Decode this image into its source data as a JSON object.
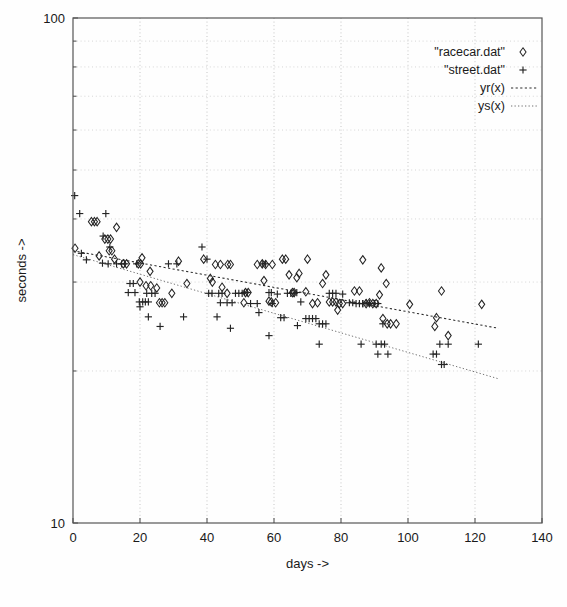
{
  "chart_data": {
    "type": "scatter",
    "title": "",
    "xlabel": "days ->",
    "ylabel": "seconds  ->",
    "xlim": [
      0,
      140
    ],
    "ylim": [
      10,
      100
    ],
    "yscale": "log",
    "xscale": "linear",
    "grid": true,
    "legend_position": "top-right",
    "xticks": [
      0,
      20,
      40,
      60,
      80,
      100,
      120,
      140
    ],
    "xtick_labels": [
      "0",
      "20",
      "40",
      "60",
      "80",
      "100",
      "120",
      "140"
    ],
    "yticks": [
      10,
      100
    ],
    "ytick_labels": [
      "10",
      "100"
    ],
    "y_minor_gridlines": [
      20,
      30,
      40,
      50,
      60,
      70,
      80,
      90
    ],
    "legend": [
      {
        "label": "\"racecar.dat\"",
        "marker": "diamond",
        "kind": "points"
      },
      {
        "label": "\"street.dat\"",
        "marker": "plus",
        "kind": "points"
      },
      {
        "label": "yr(x)",
        "marker": "dashed-line",
        "kind": "line"
      },
      {
        "label": "ys(x)",
        "marker": "dotted-line",
        "kind": "line"
      }
    ],
    "series": [
      {
        "name": "\"racecar.dat\"",
        "marker": "diamond",
        "points": [
          [
            0.6,
            35.0
          ],
          [
            5.5,
            39.5
          ],
          [
            6.4,
            39.5
          ],
          [
            7.2,
            39.5
          ],
          [
            9.5,
            36.5
          ],
          [
            10.4,
            36.5
          ],
          [
            11.2,
            36.5
          ],
          [
            13.0,
            38.5
          ],
          [
            7.8,
            33.8
          ],
          [
            10.8,
            34.6
          ],
          [
            11.6,
            34.6
          ],
          [
            12.4,
            33.3
          ],
          [
            15.0,
            32.6
          ],
          [
            16.0,
            32.6
          ],
          [
            19.5,
            32.6
          ],
          [
            20.2,
            32.6
          ],
          [
            20.6,
            33.5
          ],
          [
            23.0,
            31.5
          ],
          [
            20.0,
            30.0
          ],
          [
            21.8,
            29.5
          ],
          [
            23.2,
            29.5
          ],
          [
            25.0,
            29.2
          ],
          [
            25.8,
            27.3
          ],
          [
            26.6,
            27.3
          ],
          [
            27.4,
            27.3
          ],
          [
            29.5,
            28.5
          ],
          [
            31.5,
            33.0
          ],
          [
            34.0,
            29.8
          ],
          [
            39.0,
            33.3
          ],
          [
            41.0,
            30.5
          ],
          [
            41.6,
            30.0
          ],
          [
            42.5,
            32.5
          ],
          [
            44.0,
            32.5
          ],
          [
            44.5,
            29.3
          ],
          [
            46.2,
            32.5
          ],
          [
            47.0,
            32.5
          ],
          [
            46.0,
            28.5
          ],
          [
            51.5,
            28.6
          ],
          [
            52.3,
            28.6
          ],
          [
            51.0,
            27.3
          ],
          [
            55.0,
            32.5
          ],
          [
            56.5,
            32.6
          ],
          [
            57.5,
            32.5
          ],
          [
            57.0,
            30.2
          ],
          [
            59.5,
            32.5
          ],
          [
            58.5,
            27.5
          ],
          [
            59.2,
            27.4
          ],
          [
            60.5,
            27.3
          ],
          [
            62.5,
            33.3
          ],
          [
            63.5,
            33.3
          ],
          [
            64.5,
            31.0
          ],
          [
            65.5,
            28.6
          ],
          [
            66.0,
            28.6
          ],
          [
            66.8,
            30.6
          ],
          [
            67.5,
            31.2
          ],
          [
            69.5,
            28.7
          ],
          [
            70.0,
            33.3
          ],
          [
            71.5,
            27.2
          ],
          [
            73.0,
            27.3
          ],
          [
            74.5,
            29.8
          ],
          [
            75.5,
            31.0
          ],
          [
            76.5,
            27.4
          ],
          [
            77.5,
            27.4
          ],
          [
            78.5,
            27.4
          ],
          [
            79.5,
            27.2
          ],
          [
            79.0,
            26.4
          ],
          [
            80.5,
            27.2
          ],
          [
            84.0,
            28.8
          ],
          [
            85.5,
            28.8
          ],
          [
            86.5,
            33.2
          ],
          [
            87.5,
            27.2
          ],
          [
            88.5,
            27.3
          ],
          [
            89.5,
            27.2
          ],
          [
            90.5,
            27.2
          ],
          [
            92.0,
            32.0
          ],
          [
            91.5,
            28.3
          ],
          [
            92.5,
            25.4
          ],
          [
            93.8,
            24.8
          ],
          [
            94.8,
            24.8
          ],
          [
            96.5,
            24.8
          ],
          [
            93.5,
            29.8
          ],
          [
            100.5,
            27.1
          ],
          [
            108.5,
            25.5
          ],
          [
            108.0,
            24.5
          ],
          [
            110.0,
            28.8
          ],
          [
            112.0,
            23.5
          ],
          [
            122.0,
            27.1
          ]
        ]
      },
      {
        "name": "\"street.dat\"",
        "marker": "plus",
        "points": [
          [
            0.5,
            44.5
          ],
          [
            2.0,
            41.0
          ],
          [
            9.8,
            41.0
          ],
          [
            2.5,
            34.2
          ],
          [
            4.0,
            33.2
          ],
          [
            9.0,
            37.0
          ],
          [
            11.0,
            35.2
          ],
          [
            8.8,
            32.7
          ],
          [
            10.5,
            32.6
          ],
          [
            13.0,
            32.6
          ],
          [
            14.5,
            32.6
          ],
          [
            15.5,
            32.6
          ],
          [
            17.0,
            29.8
          ],
          [
            18.0,
            29.8
          ],
          [
            19.0,
            32.6
          ],
          [
            19.8,
            27.4
          ],
          [
            20.8,
            27.4
          ],
          [
            21.6,
            27.4
          ],
          [
            22.5,
            27.4
          ],
          [
            16.5,
            28.6
          ],
          [
            18.5,
            28.6
          ],
          [
            20.0,
            26.8
          ],
          [
            22.0,
            28.5
          ],
          [
            23.5,
            28.5
          ],
          [
            24.5,
            28.5
          ],
          [
            28.5,
            32.6
          ],
          [
            31.0,
            32.6
          ],
          [
            22.5,
            25.6
          ],
          [
            26.0,
            24.5
          ],
          [
            38.5,
            35.2
          ],
          [
            40.0,
            33.3
          ],
          [
            40.5,
            28.5
          ],
          [
            41.5,
            28.5
          ],
          [
            43.5,
            28.5
          ],
          [
            44.5,
            28.5
          ],
          [
            44.0,
            27.3
          ],
          [
            46.0,
            27.3
          ],
          [
            47.5,
            27.3
          ],
          [
            43.0,
            25.6
          ],
          [
            48.5,
            28.5
          ],
          [
            49.5,
            28.5
          ],
          [
            50.5,
            28.5
          ],
          [
            51.2,
            28.6
          ],
          [
            52.0,
            28.6
          ],
          [
            53.0,
            27.2
          ],
          [
            55.0,
            27.2
          ],
          [
            56.5,
            32.6
          ],
          [
            57.5,
            32.6
          ],
          [
            58.5,
            28.6
          ],
          [
            59.2,
            28.6
          ],
          [
            59.5,
            27.2
          ],
          [
            61.0,
            28.4
          ],
          [
            62.0,
            25.5
          ],
          [
            63.0,
            25.5
          ],
          [
            64.0,
            28.5
          ],
          [
            65.0,
            28.5
          ],
          [
            66.0,
            28.5
          ],
          [
            66.8,
            28.6
          ],
          [
            68.0,
            27.4
          ],
          [
            67.0,
            24.6
          ],
          [
            69.5,
            25.4
          ],
          [
            70.5,
            25.4
          ],
          [
            71.5,
            25.4
          ],
          [
            72.5,
            25.4
          ],
          [
            73.5,
            24.8
          ],
          [
            74.5,
            24.8
          ],
          [
            75.5,
            24.8
          ],
          [
            76.5,
            28.5
          ],
          [
            77.5,
            28.5
          ],
          [
            78.5,
            28.5
          ],
          [
            80.5,
            28.4
          ],
          [
            82.5,
            27.3
          ],
          [
            83.5,
            27.3
          ],
          [
            84.5,
            27.2
          ],
          [
            85.5,
            27.2
          ],
          [
            86.5,
            27.2
          ],
          [
            87.5,
            27.3
          ],
          [
            88.5,
            27.2
          ],
          [
            90.0,
            27.2
          ],
          [
            91.0,
            27.2
          ],
          [
            92.5,
            24.8
          ],
          [
            55.5,
            26.1
          ],
          [
            58.5,
            23.5
          ],
          [
            73.5,
            22.6
          ],
          [
            86.0,
            22.6
          ],
          [
            90.5,
            22.6
          ],
          [
            92.0,
            22.6
          ],
          [
            93.0,
            22.6
          ],
          [
            91.0,
            21.6
          ],
          [
            94.0,
            21.6
          ],
          [
            107.5,
            21.6
          ],
          [
            108.5,
            21.6
          ],
          [
            109.5,
            22.6
          ],
          [
            112.0,
            22.6
          ],
          [
            121.0,
            22.6
          ],
          [
            110.0,
            20.6
          ],
          [
            110.8,
            20.6
          ],
          [
            47.0,
            24.3
          ],
          [
            33.0,
            25.6
          ],
          [
            86.5,
            27.2
          ]
        ]
      }
    ],
    "fit_lines": [
      {
        "name": "yr(x)",
        "x_start": 0,
        "y_start": 34.6,
        "x_end": 127,
        "y_end": 24.3,
        "style": "dashed"
      },
      {
        "name": "ys(x)",
        "x_start": 0,
        "y_start": 34.0,
        "x_end": 127,
        "y_end": 19.3,
        "style": "dotted"
      }
    ]
  },
  "caption": ""
}
